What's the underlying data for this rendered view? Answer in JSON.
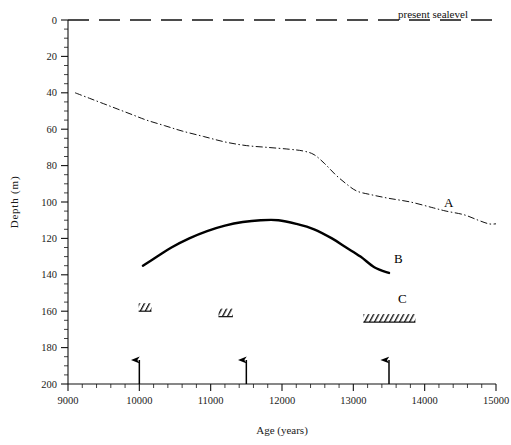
{
  "figure": {
    "title": "",
    "background": "#ffffff",
    "ink_color": "#000000"
  },
  "axes": {
    "x": {
      "label": "Age (years)",
      "min": 9000,
      "max": 15000,
      "major_step": 1000,
      "minor_step": 200,
      "ticks": [
        "9000",
        "10000",
        "11000",
        "12000",
        "13000",
        "14000",
        "15000"
      ]
    },
    "y": {
      "label": "Depth (m)",
      "min": 0,
      "max": 200,
      "major_step": 20,
      "minor_step": 5,
      "inverted": true,
      "ticks": [
        "0",
        "20",
        "40",
        "60",
        "80",
        "100",
        "120",
        "140",
        "160",
        "180",
        "200"
      ]
    }
  },
  "annotations": {
    "sealevel_label": "present sealevel",
    "label_a": "A",
    "label_b": "B",
    "label_c": "C"
  },
  "chart_data": {
    "type": "line",
    "title": "",
    "xlabel": "Age (years)",
    "ylabel": "Depth (m)",
    "xlim": [
      9000,
      15000
    ],
    "ylim": [
      200,
      0
    ],
    "y_inverted": true,
    "grid": false,
    "legend": "inline-curve-labels",
    "series": [
      {
        "name": "A",
        "style": "dash-dot",
        "linewidth": 1,
        "color": "#111111",
        "label_position": {
          "x": 14450,
          "y": 97
        },
        "points": [
          {
            "x": 9100,
            "y": 40
          },
          {
            "x": 9300,
            "y": 43
          },
          {
            "x": 9500,
            "y": 46
          },
          {
            "x": 9700,
            "y": 49
          },
          {
            "x": 9900,
            "y": 52
          },
          {
            "x": 10100,
            "y": 55
          },
          {
            "x": 10350,
            "y": 58
          },
          {
            "x": 10600,
            "y": 61
          },
          {
            "x": 10900,
            "y": 64
          },
          {
            "x": 11200,
            "y": 67
          },
          {
            "x": 11500,
            "y": 69
          },
          {
            "x": 11800,
            "y": 70
          },
          {
            "x": 12100,
            "y": 71
          },
          {
            "x": 12300,
            "y": 72
          },
          {
            "x": 12450,
            "y": 74
          },
          {
            "x": 12600,
            "y": 79
          },
          {
            "x": 12750,
            "y": 85
          },
          {
            "x": 12900,
            "y": 90
          },
          {
            "x": 13050,
            "y": 94
          },
          {
            "x": 13250,
            "y": 96
          },
          {
            "x": 13500,
            "y": 98
          },
          {
            "x": 13800,
            "y": 100
          },
          {
            "x": 14100,
            "y": 103
          },
          {
            "x": 14300,
            "y": 105
          },
          {
            "x": 14550,
            "y": 107
          },
          {
            "x": 14750,
            "y": 110
          },
          {
            "x": 14900,
            "y": 112
          },
          {
            "x": 15000,
            "y": 112
          }
        ]
      },
      {
        "name": "B",
        "style": "solid",
        "linewidth": 2.4,
        "color": "#000000",
        "label_position": {
          "x": 13620,
          "y": 131
        },
        "points": [
          {
            "x": 10050,
            "y": 135
          },
          {
            "x": 10250,
            "y": 130
          },
          {
            "x": 10450,
            "y": 125
          },
          {
            "x": 10700,
            "y": 120
          },
          {
            "x": 10950,
            "y": 116
          },
          {
            "x": 11200,
            "y": 113
          },
          {
            "x": 11450,
            "y": 111
          },
          {
            "x": 11700,
            "y": 110
          },
          {
            "x": 11950,
            "y": 110
          },
          {
            "x": 12200,
            "y": 112
          },
          {
            "x": 12450,
            "y": 115
          },
          {
            "x": 12700,
            "y": 120
          },
          {
            "x": 12900,
            "y": 125
          },
          {
            "x": 13100,
            "y": 130
          },
          {
            "x": 13300,
            "y": 136
          },
          {
            "x": 13500,
            "y": 139
          }
        ]
      }
    ],
    "reference_lines": [
      {
        "name": "present sealevel",
        "orientation": "horizontal",
        "y": 0,
        "style": "dashed",
        "label": "present sealevel"
      }
    ],
    "hatched_bars": {
      "name": "C",
      "pattern": "forward-hatch",
      "bars": [
        {
          "x_start": 9990,
          "x_end": 10170,
          "y": 160
        },
        {
          "x_start": 11110,
          "x_end": 11310,
          "y": 163
        },
        {
          "x_start": 13140,
          "x_end": 13870,
          "y": 166
        }
      ]
    },
    "event_arrows": [
      {
        "x": 10000,
        "y_base": 200,
        "direction": "up"
      },
      {
        "x": 11500,
        "y_base": 200,
        "direction": "up"
      },
      {
        "x": 13500,
        "y_base": 200,
        "direction": "up"
      }
    ]
  }
}
